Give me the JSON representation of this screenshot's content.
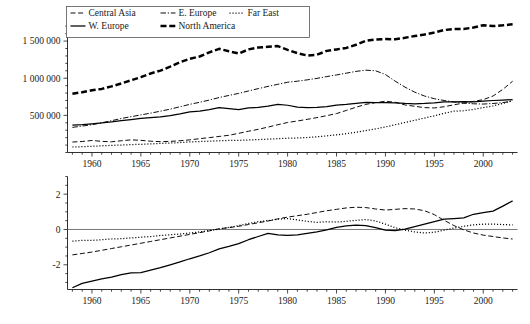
{
  "chart_data": [
    {
      "id": "top",
      "type": "line",
      "title": "",
      "xlabel": "",
      "ylabel": "",
      "xlim": [
        1957.5,
        2003.5
      ],
      "ylim": [
        0,
        1750000
      ],
      "xticks": [
        1960,
        1965,
        1970,
        1975,
        1980,
        1985,
        1990,
        1995,
        2000
      ],
      "xticklabels": [
        "1960",
        "1965",
        "1970",
        "1975",
        "1980",
        "1985",
        "1990",
        "1995",
        "2000"
      ],
      "yticks": [
        500000,
        1000000,
        1500000
      ],
      "yticklabels": [
        "500 000",
        "1 000 000",
        "1 500 000"
      ],
      "grid": false,
      "legend_position": "top",
      "x": [
        1958,
        1959,
        1960,
        1961,
        1962,
        1963,
        1964,
        1965,
        1966,
        1967,
        1968,
        1969,
        1970,
        1971,
        1972,
        1973,
        1974,
        1975,
        1976,
        1977,
        1978,
        1979,
        1980,
        1981,
        1982,
        1983,
        1984,
        1985,
        1986,
        1987,
        1988,
        1989,
        1990,
        1991,
        1992,
        1993,
        1994,
        1995,
        1996,
        1997,
        1998,
        1999,
        2000,
        2001,
        2002,
        2003
      ],
      "series": [
        {
          "name": "Central Asia",
          "style": "dashed",
          "values": [
            141000,
            148000,
            162000,
            150000,
            144000,
            158000,
            170000,
            164000,
            152000,
            146000,
            150000,
            158000,
            170000,
            186000,
            200000,
            216000,
            232000,
            258000,
            286000,
            312000,
            342000,
            374000,
            404000,
            424000,
            446000,
            470000,
            496000,
            524000,
            566000,
            610000,
            648000,
            672000,
            690000,
            676000,
            640000,
            622000,
            604000,
            600000,
            616000,
            642000,
            666000,
            688000,
            712000,
            760000,
            850000,
            960000
          ]
        },
        {
          "name": "E. Europe",
          "style": "dashdot",
          "values": [
            338000,
            356000,
            374000,
            400000,
            428000,
            458000,
            482000,
            506000,
            530000,
            556000,
            584000,
            616000,
            648000,
            676000,
            706000,
            740000,
            768000,
            796000,
            828000,
            860000,
            890000,
            918000,
            946000,
            960000,
            978000,
            998000,
            1022000,
            1044000,
            1068000,
            1092000,
            1108000,
            1100000,
            1050000,
            960000,
            880000,
            812000,
            760000,
            724000,
            700000,
            680000,
            664000,
            656000,
            652000,
            660000,
            672000,
            690000
          ]
        },
        {
          "name": "Far East",
          "style": "dotted",
          "values": [
            74000,
            78000,
            84000,
            90000,
            96000,
            100000,
            106000,
            110000,
            116000,
            122000,
            128000,
            134000,
            142000,
            148000,
            152000,
            158000,
            162000,
            164000,
            168000,
            174000,
            180000,
            186000,
            192000,
            196000,
            202000,
            212000,
            224000,
            238000,
            254000,
            272000,
            294000,
            318000,
            344000,
            374000,
            404000,
            434000,
            464000,
            494000,
            528000,
            556000,
            562000,
            580000,
            604000,
            628000,
            660000,
            700000
          ]
        },
        {
          "name": "W. Europe",
          "style": "solid",
          "values": [
            370000,
            376000,
            386000,
            398000,
            412000,
            430000,
            444000,
            458000,
            470000,
            480000,
            498000,
            520000,
            546000,
            558000,
            576000,
            604000,
            592000,
            578000,
            600000,
            606000,
            624000,
            648000,
            636000,
            612000,
            604000,
            606000,
            616000,
            638000,
            648000,
            662000,
            676000,
            672000,
            670000,
            668000,
            660000,
            656000,
            660000,
            668000,
            682000,
            680000,
            684000,
            682000,
            690000,
            700000,
            706000,
            712000
          ]
        },
        {
          "name": "North America",
          "style": "thick-dashed",
          "values": [
            790000,
            812000,
            838000,
            856000,
            890000,
            930000,
            972000,
            1014000,
            1064000,
            1102000,
            1156000,
            1216000,
            1262000,
            1292000,
            1348000,
            1396000,
            1362000,
            1332000,
            1388000,
            1414000,
            1422000,
            1432000,
            1382000,
            1338000,
            1306000,
            1316000,
            1368000,
            1388000,
            1408000,
            1450000,
            1504000,
            1522000,
            1528000,
            1524000,
            1544000,
            1568000,
            1588000,
            1616000,
            1648000,
            1664000,
            1664000,
            1682000,
            1714000,
            1702000,
            1712000,
            1726000
          ]
        }
      ]
    },
    {
      "id": "bottom",
      "type": "line",
      "title": "",
      "xlabel": "",
      "ylabel": "",
      "xlim": [
        1957.5,
        2003.5
      ],
      "ylim": [
        -3.4,
        3.0
      ],
      "xticks": [
        1960,
        1965,
        1970,
        1975,
        1980,
        1985,
        1990,
        1995,
        2000
      ],
      "xticklabels": [
        "1960",
        "1965",
        "1970",
        "1975",
        "1980",
        "1985",
        "1990",
        "1995",
        "2000"
      ],
      "yticks": [
        -2,
        0,
        2
      ],
      "yticklabels": [
        "-2",
        "0",
        "2"
      ],
      "grid": false,
      "legend_position": "bottom-right",
      "x": [
        1958,
        1959,
        1960,
        1961,
        1962,
        1963,
        1964,
        1965,
        1966,
        1967,
        1968,
        1969,
        1970,
        1971,
        1972,
        1973,
        1974,
        1975,
        1976,
        1977,
        1978,
        1979,
        1980,
        1981,
        1982,
        1983,
        1984,
        1985,
        1986,
        1987,
        1988,
        1989,
        1990,
        1991,
        1992,
        1993,
        1994,
        1995,
        1996,
        1997,
        1998,
        1999,
        2000,
        2001,
        2002,
        2003
      ],
      "series": [
        {
          "name": "CO2 emissions comp. 1",
          "label_main": "CO",
          "label_sub": "2",
          "label_rest": " emissions comp. 1",
          "style": "solid",
          "values": [
            -3.3,
            -3.05,
            -2.92,
            -2.8,
            -2.7,
            -2.56,
            -2.46,
            -2.44,
            -2.3,
            -2.16,
            -2.0,
            -1.84,
            -1.66,
            -1.5,
            -1.32,
            -1.1,
            -0.96,
            -0.8,
            -0.58,
            -0.4,
            -0.22,
            -0.3,
            -0.34,
            -0.3,
            -0.22,
            -0.14,
            -0.02,
            0.12,
            0.2,
            0.24,
            0.22,
            0.1,
            -0.04,
            -0.06,
            0.02,
            0.16,
            0.3,
            0.44,
            0.58,
            0.62,
            0.66,
            0.86,
            0.96,
            1.04,
            1.32,
            1.62
          ]
        },
        {
          "name": "CO2 emissions comp. 2",
          "label_main": "CO",
          "label_sub": "2",
          "label_rest": " emissions comp. 2",
          "style": "dashed",
          "values": [
            -1.44,
            -1.36,
            -1.28,
            -1.18,
            -1.08,
            -0.98,
            -0.88,
            -0.78,
            -0.68,
            -0.58,
            -0.48,
            -0.38,
            -0.28,
            -0.18,
            -0.08,
            0.04,
            0.1,
            0.18,
            0.28,
            0.38,
            0.48,
            0.6,
            0.7,
            0.78,
            0.86,
            0.96,
            1.06,
            1.14,
            1.22,
            1.26,
            1.24,
            1.16,
            1.1,
            1.14,
            1.18,
            1.16,
            1.06,
            0.84,
            0.52,
            0.22,
            -0.02,
            -0.2,
            -0.32,
            -0.4,
            -0.48,
            -0.54
          ]
        },
        {
          "name": "CO2 emissions comp. 3",
          "label_main": "CO",
          "label_sub": "2",
          "label_rest": " emissions comp. 3",
          "style": "dotted",
          "values": [
            -0.66,
            -0.62,
            -0.62,
            -0.58,
            -0.54,
            -0.52,
            -0.48,
            -0.44,
            -0.4,
            -0.34,
            -0.3,
            -0.26,
            -0.2,
            -0.14,
            -0.06,
            0.02,
            0.12,
            0.22,
            0.34,
            0.44,
            0.5,
            0.58,
            0.62,
            0.54,
            0.46,
            0.4,
            0.44,
            0.42,
            0.46,
            0.52,
            0.56,
            0.48,
            0.3,
            0.1,
            -0.04,
            -0.14,
            -0.2,
            -0.16,
            -0.04,
            0.08,
            0.18,
            0.26,
            0.3,
            0.3,
            0.28,
            0.26
          ]
        }
      ]
    }
  ],
  "top_legend": {
    "entries": [
      {
        "label": "Central Asia",
        "style": "dashed"
      },
      {
        "label": "E. Europe",
        "style": "dashdot"
      },
      {
        "label": "Far East",
        "style": "dotted"
      },
      {
        "label": "W. Europe",
        "style": "solid"
      },
      {
        "label": "North America",
        "style": "thick-dashed"
      }
    ]
  },
  "bottom_legend": {
    "entries": [
      {
        "main": "CO",
        "sub": "2",
        "rest": " emissions comp. 1",
        "style": "solid"
      },
      {
        "main": "CO",
        "sub": "2",
        "rest": " emissions comp. 2",
        "style": "dashed"
      },
      {
        "main": "CO",
        "sub": "2",
        "rest": " emissions comp. 3",
        "style": "dotted"
      }
    ]
  }
}
